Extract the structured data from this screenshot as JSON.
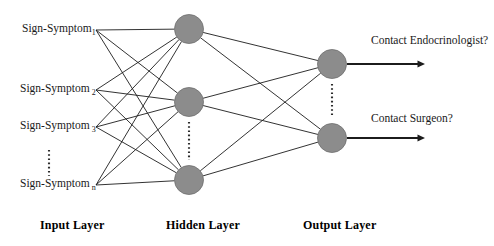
{
  "diagram": {
    "colors": {
      "node_fill": "#8c8c8c",
      "node_stroke": "#6f6f6f",
      "edge": "#1c1c1c",
      "text": "#1a1a1a",
      "background": "#ffffff"
    }
  },
  "input_layer": {
    "label": "Input Layer",
    "label_x": 40,
    "label_y": 218,
    "nodes": [
      {
        "base": "Sign-Symptom",
        "subscript": "1",
        "gap": false,
        "x": 96,
        "y": 34,
        "anchor_x": 96,
        "anchor_y": 30
      },
      {
        "base": "Sign-Symptom",
        "subscript": "2",
        "gap": true,
        "x": 96,
        "y": 94,
        "anchor_x": 96,
        "anchor_y": 90
      },
      {
        "base": "Sign-Symptom",
        "subscript": "3",
        "gap": true,
        "x": 96,
        "y": 131,
        "anchor_x": 96,
        "anchor_y": 127
      },
      {
        "base": "Sign-Symptom",
        "subscript": "n",
        "gap": true,
        "x": 96,
        "y": 189,
        "anchor_x": 96,
        "anchor_y": 185
      }
    ],
    "ellipsis": {
      "x": 49,
      "y_top": 150,
      "y_bottom": 176
    }
  },
  "hidden_layer": {
    "label": "Hidden Layer",
    "label_x": 166,
    "label_y": 218,
    "nodes": [
      {
        "cx": 189,
        "cy": 29,
        "r": 14.5
      },
      {
        "cx": 189,
        "cy": 102,
        "r": 14.5
      },
      {
        "cx": 189,
        "cy": 180,
        "r": 14.5
      }
    ],
    "ellipsis": {
      "x": 189,
      "y_top": 122,
      "y_bottom": 160
    }
  },
  "output_layer": {
    "label": "Output Layer",
    "label_x": 303,
    "label_y": 218,
    "nodes": [
      {
        "cx": 332,
        "cy": 64,
        "r": 14.5,
        "text": "Contact Endocrinologist?",
        "text_x": 371,
        "text_y": 35,
        "arrow_x1": 347,
        "arrow_x2": 425,
        "arrow_y": 64
      },
      {
        "cx": 332,
        "cy": 138,
        "r": 14.5,
        "text": "Contact Surgeon?",
        "text_x": 371,
        "text_y": 113,
        "arrow_x1": 347,
        "arrow_x2": 425,
        "arrow_y": 138
      }
    ],
    "ellipsis": {
      "x": 332,
      "y_top": 84,
      "y_bottom": 116
    }
  },
  "edges": {
    "input_to_hidden": [
      [
        0,
        0
      ],
      [
        0,
        1
      ],
      [
        0,
        2
      ],
      [
        1,
        0
      ],
      [
        1,
        1
      ],
      [
        1,
        2
      ],
      [
        2,
        0
      ],
      [
        2,
        1
      ],
      [
        2,
        2
      ],
      [
        3,
        0
      ],
      [
        3,
        1
      ],
      [
        3,
        2
      ]
    ],
    "hidden_to_output": [
      [
        0,
        0
      ],
      [
        0,
        1
      ],
      [
        1,
        0
      ],
      [
        1,
        1
      ],
      [
        2,
        0
      ],
      [
        2,
        1
      ]
    ]
  }
}
